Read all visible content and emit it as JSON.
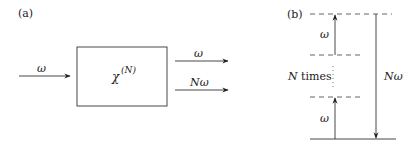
{
  "panel_a": {
    "label": "(a)",
    "input_label": "ω",
    "box_label_base": "χ",
    "box_label_sup": "(N)",
    "outputs": [
      {
        "label": "ω"
      },
      {
        "label": "Nω"
      }
    ]
  },
  "panel_b": {
    "label": "(b)",
    "upper_step_label": "ω",
    "lower_step_label": "ω",
    "repeat_label": "N times",
    "emission_label": "Nω"
  },
  "colors": {
    "line": "#333333",
    "dash": "#555555",
    "text": "#222222"
  }
}
